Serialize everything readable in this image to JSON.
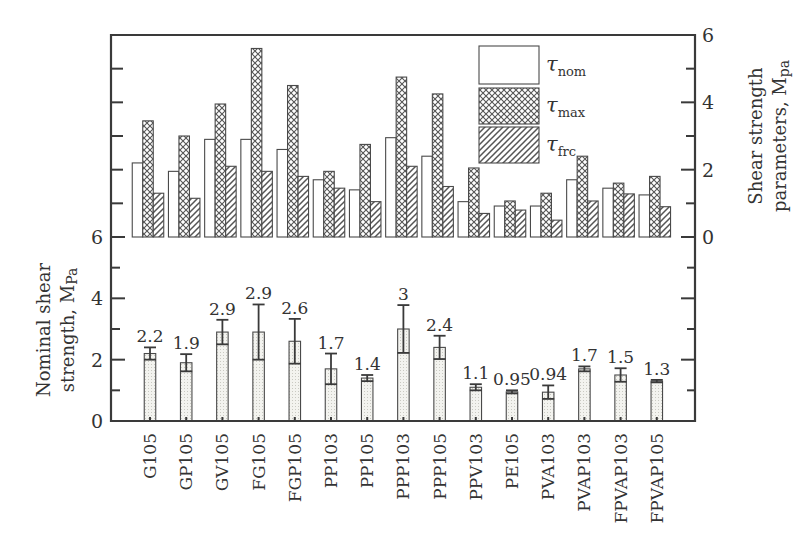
{
  "chart_data": [
    {
      "type": "bar",
      "panel": "top",
      "title": "",
      "xlabel": "",
      "ylabel": "Shear strength parameters, Mpa",
      "ylabel_side": "right",
      "ylim": [
        0,
        6
      ],
      "yticks": [
        0,
        2,
        4,
        6
      ],
      "minor_yticks": [
        1,
        3,
        5
      ],
      "grid": false,
      "legend_position": "upper right (inside)",
      "categories": [
        "G105",
        "GP105",
        "GV105",
        "FG105",
        "FGP105",
        "PP103",
        "PP105",
        "PPP103",
        "PPP105",
        "PPV103",
        "PE105",
        "PVA103",
        "PVAP103",
        "FPVAP103",
        "FPVAP105"
      ],
      "series": [
        {
          "name": "τnom",
          "label_main": "τ",
          "label_sub": "nom",
          "pattern": "blank",
          "values": [
            2.2,
            1.95,
            2.9,
            2.9,
            2.6,
            1.7,
            1.4,
            2.95,
            2.4,
            1.05,
            0.92,
            0.92,
            1.7,
            1.45,
            1.25
          ]
        },
        {
          "name": "τmax",
          "label_main": "τ",
          "label_sub": "max",
          "pattern": "crosshatch",
          "values": [
            3.45,
            3.0,
            3.95,
            5.6,
            4.5,
            1.95,
            2.75,
            4.75,
            4.25,
            2.05,
            1.07,
            1.3,
            2.4,
            1.6,
            1.8
          ]
        },
        {
          "name": "τfrc",
          "label_main": "τ",
          "label_sub": "frc",
          "pattern": "diagonal-hatch",
          "values": [
            1.3,
            1.15,
            2.1,
            1.95,
            1.8,
            1.45,
            1.05,
            2.1,
            1.5,
            0.7,
            0.8,
            0.5,
            1.07,
            1.28,
            0.9
          ]
        }
      ]
    },
    {
      "type": "bar",
      "panel": "bottom",
      "title": "",
      "xlabel": "",
      "ylabel": "Nominal shear strength, Mpa",
      "ylabel_side": "left",
      "ylim": [
        0,
        6
      ],
      "yticks": [
        0,
        2,
        4,
        6
      ],
      "minor_yticks": [
        1,
        3,
        5
      ],
      "grid": false,
      "categories": [
        "G105",
        "GP105",
        "GV105",
        "FG105",
        "FGP105",
        "PP103",
        "PP105",
        "PPP103",
        "PPP105",
        "PPV103",
        "PE105",
        "PVA103",
        "PVAP103",
        "FPVAP103",
        "FPVAP105"
      ],
      "series": [
        {
          "name": "Nominal shear strength",
          "pattern": "dotted",
          "values": [
            2.2,
            1.9,
            2.9,
            2.9,
            2.6,
            1.7,
            1.4,
            3.0,
            2.4,
            1.1,
            0.95,
            0.94,
            1.7,
            1.5,
            1.3
          ],
          "error": [
            0.2,
            0.28,
            0.4,
            0.9,
            0.73,
            0.5,
            0.1,
            0.78,
            0.38,
            0.1,
            0.05,
            0.22,
            0.08,
            0.22,
            0.04
          ]
        }
      ],
      "data_labels": [
        "2.2",
        "1.9",
        "2.9",
        "2.9",
        "2.6",
        "1.7",
        "1.4",
        "3",
        "2.4",
        "1.1",
        "0.95",
        "0.94",
        "1.7",
        "1.5",
        "1.3"
      ]
    }
  ],
  "axes": {
    "top_right_ticks": [
      "0",
      "2",
      "4",
      "6"
    ],
    "bottom_left_ticks": [
      "0",
      "2",
      "4",
      "6"
    ],
    "top_ylabel_line1": "Shear strength",
    "top_ylabel_line2_main": "parameters, M",
    "top_ylabel_line2_sub": "pa",
    "bottom_ylabel_line1": "Nominal shear",
    "bottom_ylabel_line2_main": "strength, M",
    "bottom_ylabel_line2_sub": "Pa"
  },
  "colors": {
    "axis": "#3a3a3a",
    "bar_outline": "#4a4a4a",
    "background": "#ffffff",
    "dotted_fill": "#f1f1ec"
  }
}
